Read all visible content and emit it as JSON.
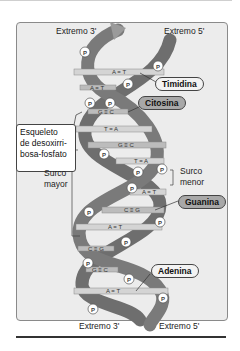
{
  "diagram": {
    "ends_top": {
      "left": "Extremo 3'",
      "right": "Extremo 5'"
    },
    "ends_bottom": {
      "left": "Extremo 3'",
      "right": "Extremo 5'"
    },
    "labels": {
      "thymine": "Timidina",
      "cytosine": "Citosina",
      "guanine": "Guanina",
      "adenine": "Adenina",
      "backbone": "Esqueleto de desoxirribosa-fosfato",
      "backbone_lines": [
        "Esqueleto",
        "de desoxirri-",
        "bosa-fosfato"
      ],
      "major_groove": [
        "Surco",
        "mayor"
      ],
      "minor_groove": [
        "Surco",
        "menor"
      ]
    },
    "phosphate_symbol": "P",
    "base_pairs": [
      {
        "label": "A = T",
        "y": 73
      },
      {
        "label": "A = T",
        "y": 88
      },
      {
        "label": "G ≡ C",
        "y": 112
      },
      {
        "label": "T = A",
        "y": 129
      },
      {
        "label": "G ≡ C",
        "y": 145
      },
      {
        "label": "T = A",
        "y": 161
      },
      {
        "label": "A = T",
        "y": 192
      },
      {
        "label": "C ≡ G",
        "y": 210
      },
      {
        "label": "A = T",
        "y": 227
      },
      {
        "label": "C ≡ G",
        "y": 249
      },
      {
        "label": "G ≡ C",
        "y": 270
      },
      {
        "label": "A = T",
        "y": 291
      }
    ],
    "colors": {
      "background": "#ececec",
      "strand": "#6e6e6e",
      "strand_light": "#9a9a9a",
      "base_bar": "#d4d4d4",
      "phosphate_fill": "#ffffff"
    }
  }
}
